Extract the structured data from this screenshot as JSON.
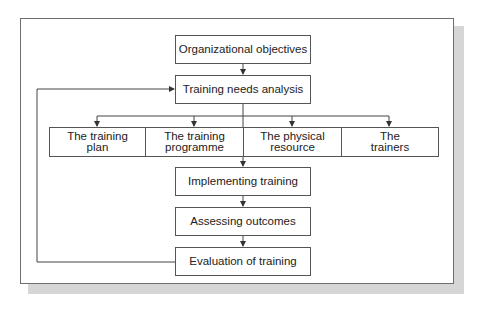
{
  "diagram": {
    "type": "flowchart",
    "nodes": {
      "org_objectives": "Organizational objectives",
      "tna": "Training needs analysis",
      "row": [
        {
          "line1": "The training",
          "line2": "plan"
        },
        {
          "line1": "The training",
          "line2": "programme"
        },
        {
          "line1": "The physical",
          "line2": "resource"
        },
        {
          "line1": "The",
          "line2": "trainers"
        }
      ],
      "implementing": "Implementing training",
      "assessing": "Assessing outcomes",
      "evaluation": "Evaluation of training"
    },
    "edges": [
      [
        "Organizational objectives",
        "Training needs analysis"
      ],
      [
        "Training needs analysis",
        "The training plan"
      ],
      [
        "Training needs analysis",
        "The training programme"
      ],
      [
        "Training needs analysis",
        "The physical resource"
      ],
      [
        "Training needs analysis",
        "The trainers"
      ],
      [
        "Training needs analysis",
        "Implementing training"
      ],
      [
        "Implementing training",
        "Assessing outcomes"
      ],
      [
        "Assessing outcomes",
        "Evaluation of training"
      ],
      [
        "Evaluation of training",
        "Training needs analysis"
      ]
    ],
    "colors": {
      "line": "#444444",
      "border": "#555555",
      "shadow": "#d6d6d6",
      "background": "#ffffff"
    }
  }
}
